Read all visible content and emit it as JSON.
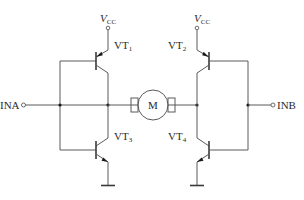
{
  "diagram": {
    "type": "H-bridge motor driver",
    "inputs": {
      "left": {
        "label": "INA"
      },
      "right": {
        "label": "INB"
      }
    },
    "supply": {
      "left": {
        "label": "V",
        "sub": "CC"
      },
      "right": {
        "label": "V",
        "sub": "CC"
      }
    },
    "transistors": [
      {
        "id": "VT1",
        "label": "VT",
        "sub": "1",
        "type": "PNP",
        "position": "top-left"
      },
      {
        "id": "VT2",
        "label": "VT",
        "sub": "2",
        "type": "PNP",
        "position": "top-right"
      },
      {
        "id": "VT3",
        "label": "VT",
        "sub": "3",
        "type": "NPN",
        "position": "bottom-left"
      },
      {
        "id": "VT4",
        "label": "VT",
        "sub": "4",
        "type": "NPN",
        "position": "bottom-right"
      }
    ],
    "motor": {
      "label": "M"
    },
    "colors": {
      "wire": "#5a5a5a",
      "text": "#2a2a2a",
      "background": "#ffffff"
    }
  }
}
